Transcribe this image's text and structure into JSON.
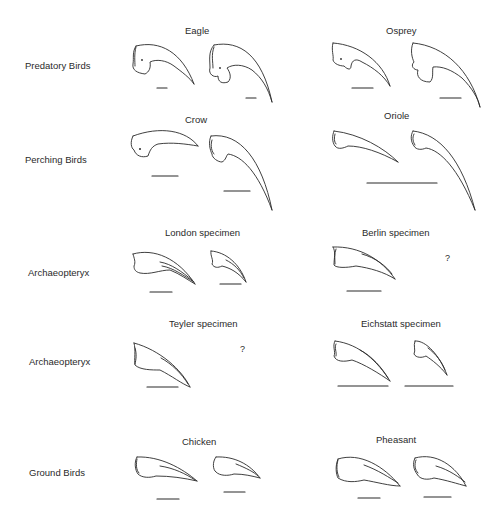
{
  "rows": [
    {
      "label": "Predatory Birds"
    },
    {
      "label": "Perching Birds"
    },
    {
      "label": "Archaeopteryx"
    },
    {
      "label": "Archaeopteryx"
    },
    {
      "label": "Ground   Birds"
    }
  ],
  "groups": {
    "eagle": {
      "title": "Eagle"
    },
    "osprey": {
      "title": "Osprey"
    },
    "crow": {
      "title": "Crow"
    },
    "oriole": {
      "title": "Oriole"
    },
    "london": {
      "title": "London specimen"
    },
    "berlin": {
      "title": "Berlin specimen",
      "missing_marker": "?"
    },
    "teyler": {
      "title": "Teyler specimen",
      "missing_marker": "?"
    },
    "eichstatt": {
      "title": "Eichstatt specimen"
    },
    "chicken": {
      "title": "Chicken"
    },
    "pheasant": {
      "title": "Pheasant"
    }
  }
}
